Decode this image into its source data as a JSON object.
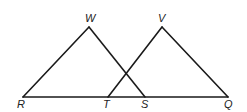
{
  "figure": {
    "points": {
      "R": {
        "label": "R",
        "x": 23,
        "y": 97
      },
      "T": {
        "label": "T",
        "x": 108,
        "y": 97
      },
      "S": {
        "label": "S",
        "x": 145,
        "y": 97
      },
      "Q": {
        "label": "Q",
        "x": 228,
        "y": 97
      },
      "W": {
        "label": "W",
        "x": 89,
        "y": 27
      },
      "V": {
        "label": "V",
        "x": 162,
        "y": 27
      }
    },
    "segments": [
      "RQ",
      "RW",
      "WS",
      "TV",
      "VQ"
    ],
    "triangles": [
      "RWS",
      "TVQ"
    ]
  }
}
